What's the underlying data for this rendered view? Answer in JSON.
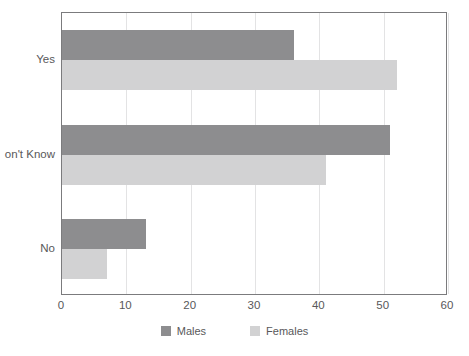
{
  "chart_data": {
    "type": "bar",
    "orientation": "horizontal",
    "title": "",
    "subtitle": "",
    "xlabel": "",
    "ylabel": "",
    "categories": [
      "Yes",
      "Don't Know",
      "No"
    ],
    "category_labels_rendered": [
      "Yes",
      "on't Know",
      "No"
    ],
    "series": [
      {
        "name": "Males",
        "color": "#8d8d8f",
        "values": [
          36,
          51,
          13
        ]
      },
      {
        "name": "Females",
        "color": "#d2d2d3",
        "values": [
          52,
          41,
          7
        ]
      }
    ],
    "xlim": [
      0,
      60
    ],
    "xticks": [
      0,
      10,
      20,
      30,
      40,
      50,
      60
    ],
    "xtick_labels": [
      "0",
      "10",
      "20",
      "30",
      "40",
      "50",
      "60"
    ],
    "grid": true,
    "grid_axis": "x",
    "legend": {
      "position": "bottom",
      "entries": [
        "Males",
        "Females"
      ]
    }
  },
  "legend": {
    "items": [
      {
        "label": "Males",
        "swatch": "legend-swatch-males"
      },
      {
        "label": "Females",
        "swatch": "legend-swatch-females"
      }
    ]
  },
  "colors": {
    "males": "#8d8d8f",
    "females": "#d2d2d3",
    "gridline": "#e3e3e4",
    "axis": "#7b7b7d",
    "text": "#58585a",
    "background": "#ffffff"
  }
}
